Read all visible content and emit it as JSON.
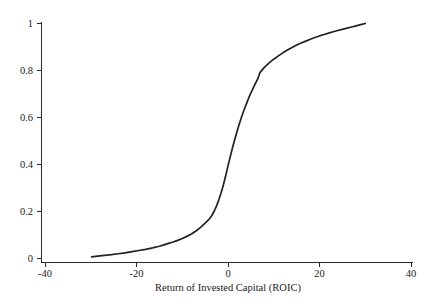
{
  "chart_data": {
    "type": "line",
    "title": "",
    "subtitle": "",
    "xlabel": "Return of Invested Capital (ROIC)",
    "ylabel": "",
    "xlim": [
      -40,
      40
    ],
    "ylim": [
      0,
      1
    ],
    "grid": false,
    "legend": null,
    "x_ticks": [
      -40,
      -20,
      0,
      20,
      40
    ],
    "x_tick_labels": [
      "-40",
      "-20",
      "0",
      "20",
      "40"
    ],
    "y_ticks": [
      0,
      0.2,
      0.4,
      0.6,
      0.8,
      1
    ],
    "y_tick_labels": [
      "0",
      "0.2",
      "0.4",
      "0.6",
      "0.8",
      "1"
    ],
    "series": [
      {
        "name": "Empirical cumulative distribution of ROIC",
        "color": "#222222",
        "x": [
          -29.8,
          -28.5,
          -27.0,
          -25.5,
          -24.0,
          -22.5,
          -21.0,
          -19.5,
          -18.0,
          -16.5,
          -15.0,
          -14.0,
          -13.0,
          -12.0,
          -11.0,
          -10.0,
          -9.0,
          -8.0,
          -7.0,
          -6.0,
          -5.0,
          -4.5,
          -4.0,
          -3.5,
          -3.0,
          -2.5,
          -2.0,
          -1.5,
          -1.0,
          -0.5,
          0.0,
          0.5,
          1.0,
          1.5,
          2.0,
          2.5,
          3.0,
          3.5,
          4.0,
          4.5,
          5.0,
          5.5,
          6.0,
          6.5,
          7.0,
          8.0,
          9.0,
          10.0,
          11.0,
          12.0,
          13.0,
          14.0,
          15.0,
          16.0,
          17.0,
          18.0,
          19.0,
          20.0,
          21.0,
          22.0,
          23.0,
          24.0,
          25.0,
          26.0,
          27.0,
          28.0,
          29.0,
          30.0
        ],
        "y": [
          0.005,
          0.008,
          0.011,
          0.014,
          0.018,
          0.022,
          0.027,
          0.032,
          0.037,
          0.043,
          0.05,
          0.056,
          0.062,
          0.068,
          0.075,
          0.083,
          0.092,
          0.102,
          0.115,
          0.13,
          0.148,
          0.158,
          0.168,
          0.182,
          0.2,
          0.222,
          0.248,
          0.278,
          0.312,
          0.35,
          0.392,
          0.432,
          0.47,
          0.505,
          0.54,
          0.572,
          0.602,
          0.63,
          0.655,
          0.68,
          0.702,
          0.723,
          0.743,
          0.762,
          0.79,
          0.812,
          0.83,
          0.846,
          0.86,
          0.873,
          0.885,
          0.896,
          0.906,
          0.915,
          0.923,
          0.931,
          0.938,
          0.945,
          0.951,
          0.957,
          0.963,
          0.968,
          0.973,
          0.978,
          0.983,
          0.988,
          0.993,
          0.998
        ]
      }
    ],
    "annotations": []
  },
  "figure": {
    "background_color": "#ffffff",
    "axis_color": "#2b2b2b",
    "text_color": "#1a1a1a"
  }
}
